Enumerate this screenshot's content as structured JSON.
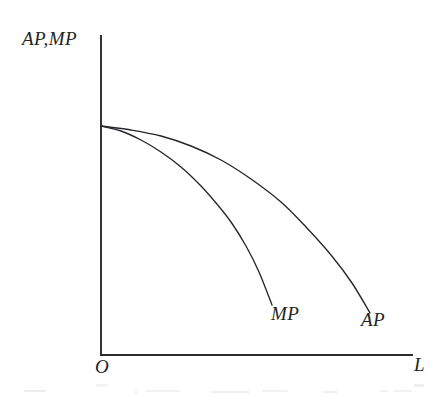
{
  "figure": {
    "background_color": "#ffffff",
    "ink_color": "#26262a",
    "axis_color": "#2b2b2b",
    "origin_label": "O",
    "y_axis_label": "AP,MP",
    "x_axis_label": "L",
    "curve_labels": {
      "mp": "MP",
      "ap": "AP"
    }
  },
  "chart_data": {
    "type": "line",
    "title": "",
    "subtitle": "",
    "xlabel": "L",
    "ylabel": "AP,MP",
    "grid": false,
    "legend": "inline-curve-end-labels",
    "axis_style": "two-axis-corner (origin at bottom-left, no tick marks, no tick labels)",
    "xlim": [
      0,
      1
    ],
    "ylim": [
      0,
      1
    ],
    "axis_pixel_geometry": {
      "origin_px": [
        101,
        355
      ],
      "y_axis_top_px": [
        101,
        36
      ],
      "x_axis_right_px": [
        412,
        355
      ]
    },
    "series": [
      {
        "name": "MP",
        "label": "MP",
        "color": "#26262a",
        "description": "Marginal product curve - steeper decline, ends first",
        "start_point_px": [
          101,
          126
        ],
        "end_point_px": [
          272,
          305
        ],
        "points_px": [
          [
            101,
            126
          ],
          [
            121,
            131
          ],
          [
            141,
            140
          ],
          [
            161,
            152
          ],
          [
            181,
            167
          ],
          [
            201,
            186
          ],
          [
            216,
            203
          ],
          [
            231,
            222
          ],
          [
            246,
            246
          ],
          [
            259,
            272
          ],
          [
            272,
            305
          ]
        ],
        "x_normalized": [
          0.0,
          0.06,
          0.13,
          0.19,
          0.26,
          0.32,
          0.37,
          0.42,
          0.47,
          0.51,
          0.55
        ],
        "y_normalized": [
          1.0,
          0.98,
          0.95,
          0.91,
          0.86,
          0.8,
          0.74,
          0.68,
          0.6,
          0.52,
          0.41
        ]
      },
      {
        "name": "AP",
        "label": "AP",
        "color": "#26262a",
        "description": "Average product curve - flatter decline, extends further right",
        "start_point_px": [
          101,
          126
        ],
        "end_point_px": [
          370,
          313
        ],
        "points_px": [
          [
            101,
            126
          ],
          [
            131,
            130
          ],
          [
            161,
            136
          ],
          [
            191,
            146
          ],
          [
            221,
            160
          ],
          [
            251,
            179
          ],
          [
            281,
            202
          ],
          [
            306,
            227
          ],
          [
            331,
            255
          ],
          [
            352,
            283
          ],
          [
            370,
            313
          ]
        ],
        "x_normalized": [
          0.0,
          0.1,
          0.19,
          0.29,
          0.39,
          0.48,
          0.58,
          0.66,
          0.74,
          0.81,
          0.87
        ],
        "y_normalized": [
          1.0,
          0.98,
          0.96,
          0.91,
          0.85,
          0.77,
          0.67,
          0.56,
          0.44,
          0.31,
          0.18
        ]
      }
    ]
  }
}
